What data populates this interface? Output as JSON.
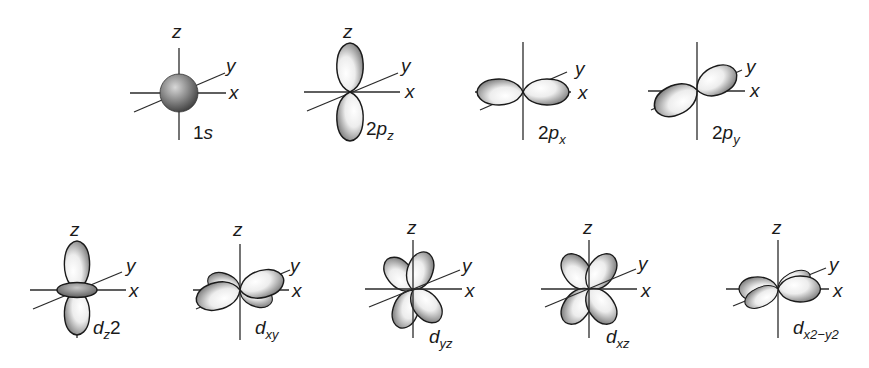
{
  "figure": {
    "title": "",
    "axis_labels": {
      "x": "x",
      "y": "y",
      "z": "z"
    },
    "orbitals": [
      {
        "id": "1s",
        "row": 1,
        "label_main": "1",
        "label_italic": "s",
        "label_sub": "",
        "label_sup": "",
        "shape": "sphere"
      },
      {
        "id": "2pz",
        "row": 1,
        "label_main": "2",
        "label_italic": "p",
        "label_sub": "z",
        "label_sup": "",
        "shape": "dumbbell along z"
      },
      {
        "id": "2px",
        "row": 1,
        "label_main": "2",
        "label_italic": "p",
        "label_sub": "x",
        "label_sup": "",
        "shape": "dumbbell along x"
      },
      {
        "id": "2py",
        "row": 1,
        "label_main": "2",
        "label_italic": "p",
        "label_sub": "y",
        "label_sup": "",
        "shape": "dumbbell along y"
      },
      {
        "id": "dz2",
        "row": 2,
        "label_main": "",
        "label_italic": "d",
        "label_sub": "z",
        "label_sup": "2",
        "shape": "dumbbell along z with torus"
      },
      {
        "id": "dxy",
        "row": 2,
        "label_main": "",
        "label_italic": "d",
        "label_sub": "xy",
        "label_sup": "",
        "shape": "four lobes in xy plane between axes"
      },
      {
        "id": "dyz",
        "row": 2,
        "label_main": "",
        "label_italic": "d",
        "label_sub": "yz",
        "label_sup": "",
        "shape": "four lobes in yz plane between axes"
      },
      {
        "id": "dxz",
        "row": 2,
        "label_main": "",
        "label_italic": "d",
        "label_sub": "xz",
        "label_sup": "",
        "shape": "four lobes in xz plane between axes"
      },
      {
        "id": "dx2-y2",
        "row": 2,
        "label_main": "",
        "label_italic": "d",
        "label_sub": "x2−y2",
        "label_sup": "",
        "shape": "four lobes along x and y axes"
      }
    ]
  },
  "colors": {
    "background": "#ffffff",
    "ink": "#1a1a1a",
    "lobe_light": "#f4f4f4",
    "lobe_dark": "#6e6e6e",
    "sphere_dark": "#3a3a3a"
  }
}
